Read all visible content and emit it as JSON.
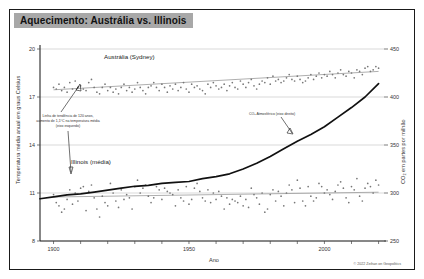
{
  "header": {
    "title": "Aquecimento: Austrália vs. Illinois"
  },
  "credit": "© 2022 Zeihan on Geopolitics",
  "labels": {
    "australia": "Austrália (Sydney)",
    "illinois": "Illinois (média)",
    "co2": "CO₂ Atmosférico (eixo direito)",
    "trend_line_1": "Linha de tendência de 120 anos,",
    "trend_line_2": "aumento de 1,1°C na temperatura média",
    "trend_line_3": "(eixo esquerdo)"
  },
  "chart_data": {
    "type": "scatter",
    "title": "Aquecimento: Austrália vs. Illinois",
    "xlabel": "Ano",
    "ylabel": "Temperatura média anual em graus Celsius",
    "y2label": "CO₂ em partes por milhão",
    "xlim": [
      1895,
      2022
    ],
    "ylim": [
      8,
      20
    ],
    "y2lim": [
      250,
      450
    ],
    "xticks": [
      1900,
      1950,
      2000
    ],
    "xtick_labels": [
      "1900",
      "1950",
      "2000"
    ],
    "yticks": [
      8,
      11,
      14,
      17,
      20
    ],
    "ytick_labels": [
      "8",
      "11",
      "14",
      "17",
      "20"
    ],
    "y2ticks": [
      250,
      300,
      350,
      400,
      450
    ],
    "y2tick_labels": [
      "250",
      "300",
      "350",
      "400",
      "450"
    ],
    "grid": true,
    "legend": "inline-annotations",
    "series": [
      {
        "name": "Austrália (Sydney)",
        "type": "scatter",
        "axis": "left",
        "x": [
          1900,
          1901,
          1902,
          1903,
          1904,
          1905,
          1906,
          1907,
          1908,
          1909,
          1910,
          1911,
          1912,
          1913,
          1914,
          1915,
          1916,
          1917,
          1918,
          1919,
          1920,
          1921,
          1922,
          1923,
          1924,
          1925,
          1926,
          1927,
          1928,
          1929,
          1930,
          1931,
          1932,
          1933,
          1934,
          1935,
          1936,
          1937,
          1938,
          1939,
          1940,
          1941,
          1942,
          1943,
          1944,
          1945,
          1946,
          1947,
          1948,
          1949,
          1950,
          1951,
          1952,
          1953,
          1954,
          1955,
          1956,
          1957,
          1958,
          1959,
          1960,
          1961,
          1962,
          1963,
          1964,
          1965,
          1966,
          1967,
          1968,
          1969,
          1970,
          1971,
          1972,
          1973,
          1974,
          1975,
          1976,
          1977,
          1978,
          1979,
          1980,
          1981,
          1982,
          1983,
          1984,
          1985,
          1986,
          1987,
          1988,
          1989,
          1990,
          1991,
          1992,
          1993,
          1994,
          1995,
          1996,
          1997,
          1998,
          1999,
          2000,
          2001,
          2002,
          2003,
          2004,
          2005,
          2006,
          2007,
          2008,
          2009,
          2010,
          2011,
          2012,
          2013,
          2014,
          2015,
          2016,
          2017,
          2018,
          2019,
          2020
        ],
        "y": [
          17.6,
          17.5,
          17.8,
          17.4,
          17.6,
          17.3,
          17.9,
          17.5,
          18.0,
          17.6,
          17.7,
          17.5,
          17.4,
          17.9,
          18.1,
          17.6,
          17.3,
          17.2,
          17.6,
          17.8,
          17.4,
          17.6,
          17.3,
          17.5,
          17.2,
          17.6,
          17.8,
          17.4,
          17.6,
          17.3,
          17.5,
          17.9,
          17.6,
          17.4,
          17.2,
          17.6,
          17.7,
          17.9,
          17.6,
          17.4,
          17.8,
          17.6,
          17.3,
          17.7,
          17.5,
          17.8,
          17.4,
          17.6,
          17.9,
          17.5,
          17.3,
          17.8,
          17.6,
          17.7,
          17.5,
          17.4,
          17.2,
          17.8,
          17.6,
          17.9,
          17.7,
          17.5,
          17.6,
          17.8,
          17.4,
          17.7,
          17.9,
          17.6,
          17.5,
          18.0,
          17.8,
          17.6,
          17.9,
          18.1,
          17.7,
          17.5,
          17.8,
          18.0,
          17.9,
          18.2,
          17.8,
          18.3,
          18.0,
          18.1,
          17.9,
          18.0,
          18.2,
          18.4,
          18.1,
          18.0,
          18.3,
          18.1,
          17.9,
          18.0,
          18.2,
          18.4,
          18.1,
          18.3,
          18.5,
          18.2,
          18.4,
          18.3,
          18.6,
          18.4,
          18.2,
          18.5,
          18.7,
          18.4,
          18.3,
          18.6,
          18.5,
          18.2,
          18.7,
          18.6,
          18.4,
          18.8,
          18.9,
          18.6,
          18.7,
          18.9,
          18.8
        ]
      },
      {
        "name": "Illinois (média)",
        "type": "scatter",
        "axis": "left",
        "x": [
          1900,
          1901,
          1902,
          1903,
          1904,
          1905,
          1906,
          1907,
          1908,
          1909,
          1910,
          1911,
          1912,
          1913,
          1914,
          1915,
          1916,
          1917,
          1918,
          1919,
          1920,
          1921,
          1922,
          1923,
          1924,
          1925,
          1926,
          1927,
          1928,
          1929,
          1930,
          1931,
          1932,
          1933,
          1934,
          1935,
          1936,
          1937,
          1938,
          1939,
          1940,
          1941,
          1942,
          1943,
          1944,
          1945,
          1946,
          1947,
          1948,
          1949,
          1950,
          1951,
          1952,
          1953,
          1954,
          1955,
          1956,
          1957,
          1958,
          1959,
          1960,
          1961,
          1962,
          1963,
          1964,
          1965,
          1966,
          1967,
          1968,
          1969,
          1970,
          1971,
          1972,
          1973,
          1974,
          1975,
          1976,
          1977,
          1978,
          1979,
          1980,
          1981,
          1982,
          1983,
          1984,
          1985,
          1986,
          1987,
          1988,
          1989,
          1990,
          1991,
          1992,
          1993,
          1994,
          1995,
          1996,
          1997,
          1998,
          1999,
          2000,
          2001,
          2002,
          2003,
          2004,
          2005,
          2006,
          2007,
          2008,
          2009,
          2010,
          2011,
          2012,
          2013,
          2014,
          2015,
          2016,
          2017,
          2018,
          2019,
          2020
        ],
        "y": [
          10.9,
          10.4,
          10.2,
          9.8,
          10.0,
          10.6,
          11.2,
          10.3,
          11.0,
          10.5,
          11.3,
          11.4,
          9.9,
          11.1,
          11.5,
          10.7,
          10.0,
          9.5,
          10.8,
          10.4,
          10.2,
          11.6,
          11.0,
          10.5,
          10.1,
          11.2,
          10.6,
          10.9,
          10.7,
          10.0,
          11.4,
          11.8,
          11.0,
          11.3,
          11.5,
          10.8,
          10.4,
          10.7,
          11.4,
          11.2,
          10.6,
          11.3,
          11.1,
          11.0,
          10.9,
          10.2,
          11.2,
          10.7,
          10.5,
          11.4,
          10.3,
          10.6,
          11.3,
          11.6,
          11.1,
          10.7,
          10.5,
          11.2,
          10.4,
          11.0,
          10.6,
          11.1,
          10.8,
          10.0,
          10.7,
          10.3,
          10.6,
          10.5,
          10.4,
          10.8,
          10.2,
          10.6,
          10.1,
          11.3,
          10.9,
          10.7,
          10.3,
          11.0,
          9.8,
          10.0,
          10.9,
          11.2,
          10.5,
          11.1,
          10.8,
          10.2,
          11.0,
          11.5,
          11.2,
          10.4,
          11.8,
          11.3,
          10.5,
          10.2,
          11.4,
          10.8,
          10.5,
          10.7,
          11.6,
          11.4,
          11.0,
          11.2,
          10.9,
          10.6,
          11.1,
          11.5,
          11.7,
          11.3,
          10.7,
          10.4,
          11.4,
          11.2,
          11.9,
          10.8,
          10.5,
          11.3,
          11.6,
          11.4,
          11.0,
          11.8,
          11.5
        ]
      },
      {
        "name": "CO₂ Atmosférico (eixo direito)",
        "type": "line",
        "axis": "right",
        "x": [
          1895,
          1900,
          1905,
          1910,
          1915,
          1920,
          1925,
          1930,
          1935,
          1940,
          1945,
          1950,
          1955,
          1960,
          1965,
          1970,
          1975,
          1980,
          1985,
          1990,
          1995,
          2000,
          2005,
          2010,
          2015,
          2020
        ],
        "y": [
          294,
          296,
          298,
          299,
          301,
          303,
          305,
          307,
          308,
          310,
          311,
          312,
          315,
          317,
          320,
          325,
          331,
          338,
          346,
          354,
          361,
          369,
          379,
          389,
          400,
          414
        ]
      }
    ],
    "trend_lines": [
      {
        "name": "Austrália trend",
        "x": [
          1900,
          2020
        ],
        "y": [
          17.45,
          18.6
        ]
      },
      {
        "name": "Illinois trend",
        "x": [
          1900,
          2020
        ],
        "y": [
          10.75,
          11.05
        ]
      }
    ]
  }
}
